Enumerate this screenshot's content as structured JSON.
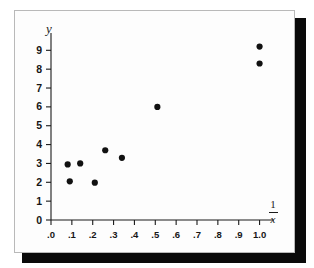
{
  "figure": {
    "background_color": "#fdfdfd",
    "page_color": "#ffffff",
    "border_color": "#b9b9b9",
    "shadow_color": "#0a0a0a",
    "axis_color": "#1a1a1a",
    "marker_color": "#111111"
  },
  "labels": {
    "y_axis": "y",
    "x_axis_numerator": "1",
    "x_axis_denominator": "x",
    "x_axis_combined": "1/x"
  },
  "chart_data": {
    "type": "scatter",
    "title": "",
    "xlabel": "1/x",
    "ylabel": "y",
    "xlim": [
      0.0,
      1.05
    ],
    "ylim": [
      0,
      9.6
    ],
    "grid": false,
    "legend": null,
    "xticks": [
      0.0,
      0.1,
      0.2,
      0.3,
      0.4,
      0.5,
      0.6,
      0.7,
      0.8,
      0.9,
      1.0
    ],
    "xticklabels": [
      ".0",
      ".1",
      ".2",
      ".3",
      ".4",
      ".5",
      ".6",
      ".7",
      ".8",
      ".9",
      "1.0"
    ],
    "yticks": [
      0,
      1,
      2,
      3,
      4,
      5,
      6,
      7,
      8,
      9
    ],
    "yticklabels": [
      "0",
      "1",
      "2",
      "3",
      "4",
      "5",
      "6",
      "7",
      "8",
      "9"
    ],
    "marker": "circle",
    "marker_size": 5,
    "points": [
      {
        "x": 0.08,
        "y": 2.95
      },
      {
        "x": 0.14,
        "y": 3.0
      },
      {
        "x": 0.09,
        "y": 2.05
      },
      {
        "x": 0.21,
        "y": 1.98
      },
      {
        "x": 0.26,
        "y": 3.7
      },
      {
        "x": 0.34,
        "y": 3.3
      },
      {
        "x": 0.51,
        "y": 6.0
      },
      {
        "x": 1.0,
        "y": 9.2
      },
      {
        "x": 1.0,
        "y": 8.3
      }
    ]
  }
}
